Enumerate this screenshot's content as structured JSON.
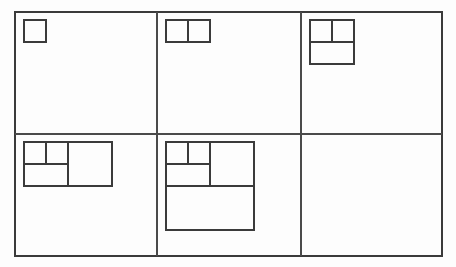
{
  "figure": {
    "background_color": "#fdfdfd",
    "line_color": "#3b3b3b",
    "divider_color": "#4a4a4a",
    "border": {
      "x": 15,
      "y": 12,
      "width": 427,
      "height": 244
    },
    "grid": {
      "columns": 3,
      "rows": 2,
      "vertical_dividers_x": [
        157,
        301
      ],
      "horizontal_dividers_y": [
        134
      ]
    },
    "unit_size": 22,
    "cells": [
      {
        "index": 1,
        "name": "cell-1-single-square",
        "label": "1",
        "origin": {
          "x": 24,
          "y": 20
        },
        "size": {
          "width": 22,
          "height": 22
        },
        "squares": [
          {
            "x": 0,
            "y": 0,
            "size": 22
          }
        ],
        "internal_lines": []
      },
      {
        "index": 2,
        "name": "cell-2-two-squares",
        "label": "1+1",
        "origin": {
          "x": 166,
          "y": 20
        },
        "size": {
          "width": 44,
          "height": 22
        },
        "squares": [
          {
            "x": 0,
            "y": 0,
            "size": 22
          },
          {
            "x": 22,
            "y": 0,
            "size": 22
          }
        ],
        "internal_lines": [
          {
            "x1": 22,
            "y1": 0,
            "x2": 22,
            "y2": 22
          }
        ]
      },
      {
        "index": 3,
        "name": "cell-3-square-pair-plus-two",
        "label": "1+1+2",
        "origin": {
          "x": 310,
          "y": 20
        },
        "size": {
          "width": 44,
          "height": 44
        },
        "squares": [
          {
            "x": 0,
            "y": 0,
            "size": 22
          },
          {
            "x": 22,
            "y": 0,
            "size": 22
          },
          {
            "x": 0,
            "y": 22,
            "size": 44
          }
        ],
        "internal_lines": [
          {
            "x1": 22,
            "y1": 0,
            "x2": 22,
            "y2": 22
          },
          {
            "x1": 0,
            "y1": 22,
            "x2": 44,
            "y2": 22
          }
        ]
      },
      {
        "index": 4,
        "name": "cell-4-plus-three",
        "label": "1+1+2+3",
        "origin": {
          "x": 24,
          "y": 142
        },
        "size": {
          "width": 88,
          "height": 44
        },
        "squares": [
          {
            "x": 0,
            "y": 0,
            "size": 22
          },
          {
            "x": 22,
            "y": 0,
            "size": 22
          },
          {
            "x": 0,
            "y": 22,
            "size": 44
          },
          {
            "x": 44,
            "y": 0,
            "size": 44
          }
        ],
        "internal_lines": [
          {
            "x1": 22,
            "y1": 0,
            "x2": 22,
            "y2": 22
          },
          {
            "x1": 0,
            "y1": 22,
            "x2": 44,
            "y2": 22
          },
          {
            "x1": 44,
            "y1": 0,
            "x2": 44,
            "y2": 44
          }
        ]
      },
      {
        "index": 5,
        "name": "cell-5-plus-four",
        "label": "1+1+2+3+4",
        "origin": {
          "x": 166,
          "y": 142
        },
        "size": {
          "width": 88,
          "height": 88
        },
        "squares": [
          {
            "x": 0,
            "y": 0,
            "size": 22
          },
          {
            "x": 22,
            "y": 0,
            "size": 22
          },
          {
            "x": 0,
            "y": 22,
            "size": 44
          },
          {
            "x": 44,
            "y": 0,
            "size": 44
          },
          {
            "x": 0,
            "y": 44,
            "size": 88
          }
        ],
        "internal_lines": [
          {
            "x1": 22,
            "y1": 0,
            "x2": 22,
            "y2": 22
          },
          {
            "x1": 0,
            "y1": 22,
            "x2": 44,
            "y2": 22
          },
          {
            "x1": 44,
            "y1": 0,
            "x2": 44,
            "y2": 44
          },
          {
            "x1": 0,
            "y1": 44,
            "x2": 88,
            "y2": 44
          }
        ]
      },
      {
        "index": 6,
        "name": "cell-6-empty",
        "label": "",
        "origin": {
          "x": 310,
          "y": 142
        },
        "size": {
          "width": 0,
          "height": 0
        },
        "squares": [],
        "internal_lines": []
      }
    ]
  }
}
